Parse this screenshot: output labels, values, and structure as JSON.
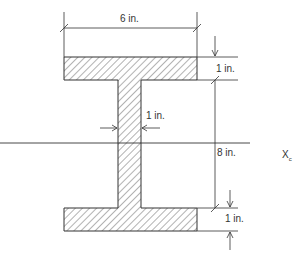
{
  "figure": {
    "type": "I-beam cross-section",
    "labels": {
      "flange_width": "6 in.",
      "top_flange_thickness": "1 in.",
      "web_thickness": "1 in.",
      "web_height": "8 in.",
      "bottom_flange_thickness": "1 in.",
      "axis_main": "X",
      "axis_sub": "c"
    },
    "colors": {
      "line": "#333333",
      "hatch": "#555555",
      "background": "#ffffff"
    }
  }
}
